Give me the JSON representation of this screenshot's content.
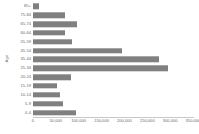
{
  "chart_data": {
    "type": "bar",
    "orientation": "horizontal",
    "title": "",
    "xlabel": "",
    "ylabel": "Age",
    "xlim": [
      0,
      350000
    ],
    "ylim": null,
    "grid": false,
    "legend": null,
    "bar_color": "#808080",
    "axis_color": "#c8c8c8",
    "tick_label_color": "#6b6b6b",
    "xticks": [
      0,
      50000,
      100000,
      150000,
      200000,
      250000,
      300000,
      350000
    ],
    "xtick_labels": [
      "0",
      "50,000",
      "100,000",
      "150,000",
      "200,000",
      "250,000",
      "300,000",
      "350,000"
    ],
    "categories": [
      "85+",
      "75-84",
      "65-74",
      "60-64",
      "55-59",
      "45-54",
      "35-44",
      "25-34",
      "20-24",
      "15-19",
      "10-14",
      "5-9",
      "0-4"
    ],
    "values": [
      14000,
      71000,
      96000,
      69000,
      86000,
      194000,
      275000,
      295000,
      84000,
      53000,
      59000,
      65000,
      93000
    ],
    "categories_bottom_to_top": [
      "0-4",
      "5-9",
      "10-14",
      "15-19",
      "20-24",
      "25-34",
      "35-44",
      "45-54",
      "55-59",
      "60-64",
      "65-74",
      "75-84",
      "85+"
    ]
  }
}
